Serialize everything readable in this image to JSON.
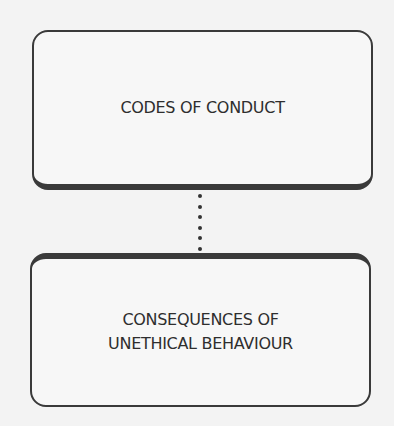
{
  "diagram": {
    "nodes": [
      {
        "id": "top",
        "label": "CODES OF CONDUCT"
      },
      {
        "id": "bottom",
        "label_lines": [
          "CONSEQUENCES OF",
          "UNETHICAL BEHAVIOUR"
        ]
      }
    ],
    "connector": {
      "from": "top",
      "to": "bottom",
      "style": "dotted",
      "dot_count": 6
    }
  }
}
